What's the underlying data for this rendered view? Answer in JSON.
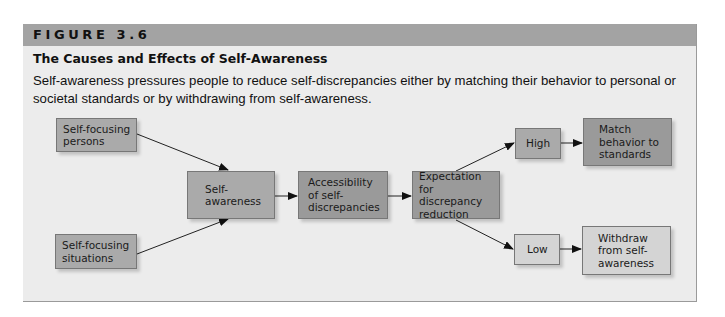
{
  "figure": {
    "label": "FIGURE 3.6",
    "title": "The Causes and Effects of Self-Awareness",
    "caption": "Self-awareness pressures people to reduce self-discrepancies either by matching their behavior to personal or societal standards or by withdrawing from self-awareness."
  },
  "diagram": {
    "nodes": [
      {
        "id": "persons",
        "text": "Self-focusing\npersons"
      },
      {
        "id": "situations",
        "text": "Self-focusing\nsituations"
      },
      {
        "id": "self_awareness",
        "text": "Self-\nawareness"
      },
      {
        "id": "accessibility",
        "text": "Accessibility\nof self-\ndiscrepancies"
      },
      {
        "id": "expectation",
        "text": "Expectation\nfor discrepancy\nreduction"
      },
      {
        "id": "high",
        "text": "High"
      },
      {
        "id": "match",
        "text": "Match\nbehavior to\nstandards"
      },
      {
        "id": "low",
        "text": "Low"
      },
      {
        "id": "withdraw",
        "text": "Withdraw\nfrom self-\nawareness"
      }
    ],
    "edges": [
      {
        "from": "persons",
        "to": "self_awareness"
      },
      {
        "from": "situations",
        "to": "self_awareness"
      },
      {
        "from": "self_awareness",
        "to": "accessibility"
      },
      {
        "from": "accessibility",
        "to": "expectation"
      },
      {
        "from": "expectation",
        "to": "high"
      },
      {
        "from": "expectation",
        "to": "low"
      },
      {
        "from": "high",
        "to": "match"
      },
      {
        "from": "low",
        "to": "withdraw"
      }
    ]
  },
  "colors": {
    "header_bar": "#a3a3a3",
    "panel_bg": "#ececec",
    "box_mid": "#aaaaaa",
    "box_dark": "#9a9a9a",
    "box_light": "#d4d4d4"
  }
}
